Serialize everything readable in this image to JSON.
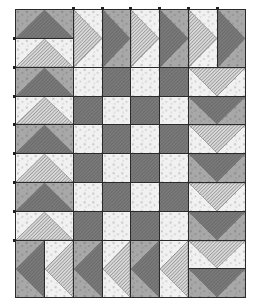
{
  "colors": {
    "light_bg": "#f1f1f1",
    "light_print": "#c9c9c9",
    "dark_bg": "#a8a8a8",
    "dark_print": "#8c8c8c",
    "light_goose": "#d9d9d9",
    "dark_goose": "#7a7a7a",
    "stripe": "#555555",
    "border": "#2a2a2a"
  },
  "grid": {
    "left": 15,
    "top": 9,
    "right": 245,
    "bottom": 297,
    "unit": 28.75
  },
  "blocks": {
    "left_column": {
      "direction": "up",
      "x": 15,
      "w": 58,
      "units": [
        {
          "y": 9,
          "h": 29,
          "tone": "dark"
        },
        {
          "y": 38,
          "h": 29,
          "tone": "light"
        },
        {
          "y": 67,
          "h": 29,
          "tone": "dark"
        },
        {
          "y": 96,
          "h": 28,
          "tone": "light"
        },
        {
          "y": 124,
          "h": 29,
          "tone": "dark"
        },
        {
          "y": 153,
          "h": 29,
          "tone": "light"
        },
        {
          "y": 182,
          "h": 29,
          "tone": "dark"
        },
        {
          "y": 211,
          "h": 29,
          "tone": "light"
        }
      ]
    },
    "top_band": {
      "direction": "right",
      "y": 9,
      "h": 58,
      "units": [
        {
          "x": 73,
          "w": 29,
          "tone": "light"
        },
        {
          "x": 102,
          "w": 28,
          "tone": "dark"
        },
        {
          "x": 130,
          "w": 29,
          "tone": "light"
        },
        {
          "x": 159,
          "w": 29,
          "tone": "dark"
        },
        {
          "x": 188,
          "w": 29,
          "tone": "light"
        },
        {
          "x": 217,
          "w": 28,
          "tone": "dark"
        }
      ]
    },
    "right_column": {
      "direction": "down",
      "x": 188,
      "w": 57,
      "units": [
        {
          "y": 67,
          "h": 29,
          "tone": "light"
        },
        {
          "y": 96,
          "h": 28,
          "tone": "dark"
        },
        {
          "y": 124,
          "h": 29,
          "tone": "light"
        },
        {
          "y": 153,
          "h": 29,
          "tone": "dark"
        },
        {
          "y": 182,
          "h": 29,
          "tone": "light"
        },
        {
          "y": 211,
          "h": 29,
          "tone": "dark"
        },
        {
          "y": 240,
          "h": 28,
          "tone": "light"
        },
        {
          "y": 268,
          "h": 29,
          "tone": "dark"
        }
      ]
    },
    "bottom_band": {
      "direction": "left",
      "y": 240,
      "h": 57,
      "units": [
        {
          "x": 15,
          "w": 29,
          "tone": "dark"
        },
        {
          "x": 44,
          "w": 29,
          "tone": "light"
        },
        {
          "x": 73,
          "w": 29,
          "tone": "dark"
        },
        {
          "x": 102,
          "w": 28,
          "tone": "light"
        },
        {
          "x": 130,
          "w": 29,
          "tone": "dark"
        },
        {
          "x": 159,
          "w": 29,
          "tone": "light"
        }
      ]
    },
    "center_checkerboard": {
      "cols": [
        73,
        102,
        130,
        159,
        188
      ],
      "rows": [
        67,
        96,
        124,
        153,
        182,
        211,
        240
      ],
      "start_tone": "light"
    }
  }
}
